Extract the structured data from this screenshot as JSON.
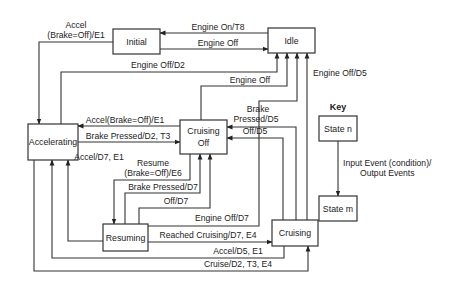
{
  "diagram": {
    "type": "state-transition",
    "states": [
      {
        "id": "initial",
        "label": "Initial"
      },
      {
        "id": "idle",
        "label": "Idle"
      },
      {
        "id": "accelerating",
        "label": "Accelerating"
      },
      {
        "id": "cruising_off",
        "label_line1": "Cruising",
        "label_line2": "Off"
      },
      {
        "id": "resuming",
        "label": "Resuming"
      },
      {
        "id": "cruising",
        "label": "Cruising"
      }
    ],
    "transitions": [
      {
        "from": "idle",
        "to": "initial",
        "label": "Engine On/T8"
      },
      {
        "from": "initial",
        "to": "idle",
        "label": "Engine Off"
      },
      {
        "from": "initial",
        "to": "accelerating",
        "label_line1": "Accel",
        "label_line2": "(Brake=Off)/E1"
      },
      {
        "from": "accelerating",
        "to": "idle",
        "label": "Engine Off/D2"
      },
      {
        "from": "cruising_off",
        "to": "idle",
        "label": "Engine Off"
      },
      {
        "from": "cruising",
        "to": "idle",
        "label": "Engine Off/D5"
      },
      {
        "from": "cruising_off",
        "to": "accelerating",
        "label": "Accel(Brake=Off)/E1"
      },
      {
        "from": "accelerating",
        "to": "cruising_off",
        "label": "Brake Pressed/D2, T3"
      },
      {
        "from": "resuming",
        "to": "accelerating",
        "label": "Accel/D7, E1"
      },
      {
        "from": "cruising",
        "to": "cruising_off",
        "label_line1": "Brake",
        "label_line2": "Pressed/D5"
      },
      {
        "from": "cruising",
        "to": "cruising_off",
        "label": "Off/D5"
      },
      {
        "from": "cruising_off",
        "to": "resuming",
        "label_line1": "Resume",
        "label_line2": "(Brake=Off)/E6"
      },
      {
        "from": "resuming",
        "to": "cruising_off",
        "label": "Brake Pressed/D7"
      },
      {
        "from": "resuming",
        "to": "cruising_off",
        "label": "Off/D7"
      },
      {
        "from": "resuming",
        "to": "idle",
        "label": "Engine Off/D7"
      },
      {
        "from": "resuming",
        "to": "cruising",
        "label": "Reached Cruising/D7, E4"
      },
      {
        "from": "cruising",
        "to": "accelerating",
        "label": "Accel/D5, E1"
      },
      {
        "from": "accelerating",
        "to": "cruising",
        "label": "Cruise/D2, T3, E4"
      }
    ],
    "key": {
      "title": "Key",
      "state_n": "State n",
      "state_m": "State m",
      "edge_line1": "Input Event (condition)/",
      "edge_line2": "Output Events"
    }
  }
}
